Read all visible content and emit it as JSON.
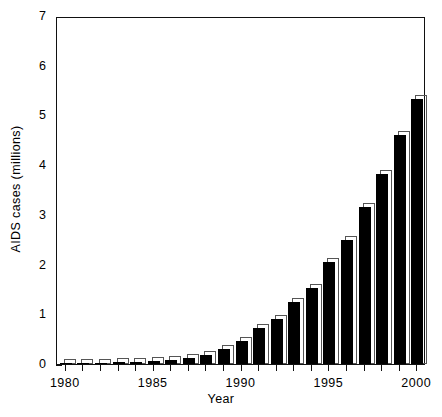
{
  "chart_data": {
    "type": "bar",
    "title": "",
    "xlabel": "Year",
    "ylabel": "AIDS cases (millions)",
    "categories": [
      1980,
      1981,
      1982,
      1983,
      1984,
      1985,
      1986,
      1987,
      1988,
      1989,
      1990,
      1991,
      1992,
      1993,
      1994,
      1995,
      1996,
      1997,
      1998,
      1999,
      2000
    ],
    "values": [
      0.01,
      0.02,
      0.03,
      0.04,
      0.05,
      0.06,
      0.08,
      0.12,
      0.18,
      0.3,
      0.47,
      0.72,
      0.9,
      1.25,
      1.52,
      2.05,
      2.5,
      3.15,
      3.82,
      4.6,
      5.33
    ],
    "xlim": [
      1979.5,
      2000.5
    ],
    "ylim": [
      0,
      7
    ],
    "ytick_labels": [
      "0",
      "1",
      "2",
      "3",
      "4",
      "5",
      "6",
      "7"
    ],
    "ytick_values": [
      0,
      1,
      2,
      3,
      4,
      5,
      6,
      7
    ],
    "xtick_labels": [
      "1980",
      "1985",
      "1990",
      "1995",
      "2000"
    ],
    "xtick_values": [
      1980,
      1985,
      1990,
      1995,
      2000
    ],
    "grid": false,
    "legend": null,
    "bar_color": "#000000",
    "bar_outline_color": "#555555",
    "axis_color": "#111111",
    "background": "#ffffff"
  }
}
